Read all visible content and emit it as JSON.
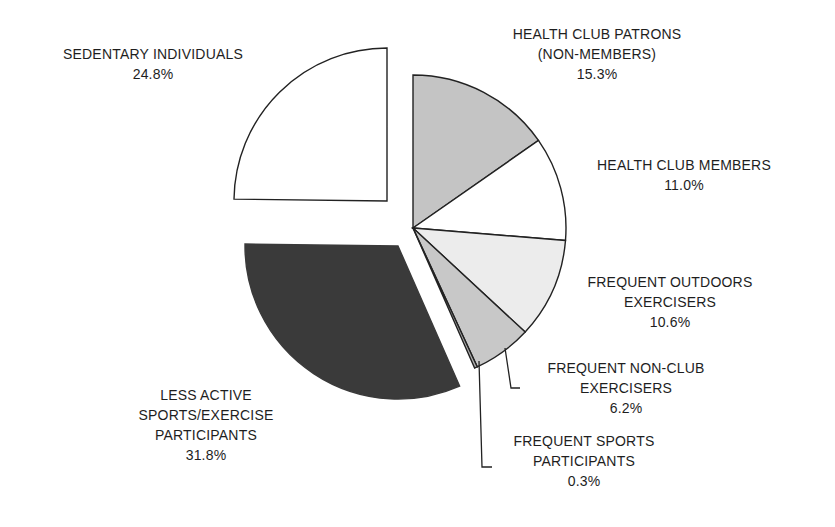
{
  "chart_data": {
    "type": "pie",
    "title": "",
    "start_angle_deg": 0,
    "direction": "clockwise",
    "exploded": [
      "Sedentary Individuals",
      "Less Active Sports/Exercise Participants"
    ],
    "slices": [
      {
        "name": "Health Club Patrons (Non-Members)",
        "label_lines": [
          "HEALTH CLUB PATRONS",
          "(NON-MEMBERS)"
        ],
        "pct_label": "15.3%",
        "value": 15.3,
        "color": "#c4c4c4"
      },
      {
        "name": "Health Club Members",
        "label_lines": [
          "HEALTH CLUB MEMBERS"
        ],
        "pct_label": "11.0%",
        "value": 11.0,
        "color": "#ffffff"
      },
      {
        "name": "Frequent Outdoors Exercisers",
        "label_lines": [
          "FREQUENT OUTDOORS",
          "EXERCISERS"
        ],
        "pct_label": "10.6%",
        "value": 10.6,
        "color": "#ececec"
      },
      {
        "name": "Frequent Non-Club Exercisers",
        "label_lines": [
          "FREQUENT NON-CLUB",
          "EXERCISERS"
        ],
        "pct_label": "6.2%",
        "value": 6.2,
        "color": "#c8c8c8"
      },
      {
        "name": "Frequent Sports Participants",
        "label_lines": [
          "FREQUENT SPORTS",
          "PARTICIPANTS"
        ],
        "pct_label": "0.3%",
        "value": 0.3,
        "color": "#b0b0b0"
      },
      {
        "name": "Less Active Sports/Exercise Participants",
        "label_lines": [
          "LESS ACTIVE",
          "SPORTS/EXERCISE",
          "PARTICIPANTS"
        ],
        "pct_label": "31.8%",
        "value": 31.8,
        "color": "#3a3a3a"
      },
      {
        "name": "Sedentary Individuals",
        "label_lines": [
          "SEDENTARY INDIVIDUALS"
        ],
        "pct_label": "24.8%",
        "value": 24.8,
        "color": "#ffffff"
      }
    ],
    "legend": "none (direct labels)",
    "outline_color": "#222222"
  }
}
